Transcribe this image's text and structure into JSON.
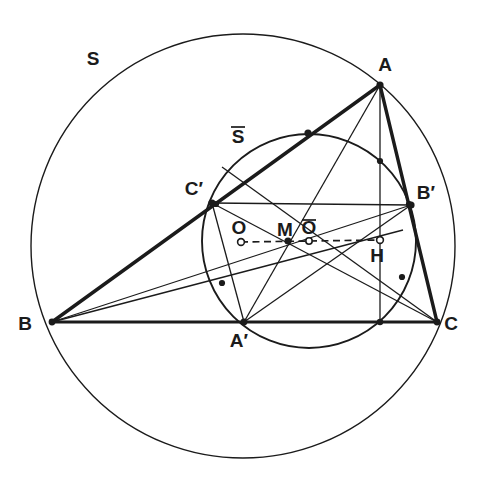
{
  "figure": {
    "background_color": "#ffffff",
    "stroke_color": "#1b1b1b",
    "width": 482,
    "height": 479
  },
  "labels": {
    "A": "A",
    "B": "B",
    "C": "C",
    "A_prime": "A′",
    "B_prime": "B′",
    "C_prime": "C′",
    "M": "M",
    "O": "O",
    "O_bar": "O",
    "H": "H",
    "S": "S",
    "S_bar": "S"
  },
  "points": {
    "A": {
      "x": 380,
      "y": 85,
      "label_dx": 5,
      "label_dy": -14,
      "marker": "dot"
    },
    "B": {
      "x": 52,
      "y": 322,
      "label_dx": -27,
      "label_dy": 7,
      "marker": "dot"
    },
    "C": {
      "x": 437,
      "y": 322,
      "label_dx": 10,
      "label_dy": 8,
      "marker": "dot"
    },
    "A_prime": {
      "x": 244,
      "y": 322,
      "label_dx": -8,
      "label_dy": 24,
      "marker": "dot"
    },
    "B_prime": {
      "x": 411,
      "y": 205,
      "label_dx": 9,
      "label_dy": -6,
      "marker": "dot"
    },
    "C_prime": {
      "x": 212,
      "y": 203,
      "label_dx": -32,
      "label_dy": -8,
      "marker": "dot"
    },
    "M": {
      "x": 288,
      "y": 241,
      "label_dx": -7,
      "label_dy": -12,
      "marker": "dot"
    },
    "O": {
      "x": 241,
      "y": 242,
      "label_dx": -7,
      "label_dy": -14,
      "marker": "open"
    },
    "O_bar": {
      "x": 309,
      "y": 241,
      "label_dx": -6,
      "label_dy": -14,
      "marker": "open"
    },
    "H": {
      "x": 380,
      "y": 240,
      "label_dx": -7,
      "label_dy": 22,
      "marker": "open"
    },
    "MidAB": {
      "x": 216,
      "y": 204
    },
    "MidAC": {
      "x": 409,
      "y": 204
    },
    "FootA": {
      "x": 380,
      "y": 322
    },
    "FootB": {
      "x": 222,
      "y": 283
    },
    "FootC": {
      "x": 403,
      "y": 276
    },
    "EulerMidAH": {
      "x": 380,
      "y": 163
    },
    "MidBH": {
      "x": 216,
      "y": 281
    },
    "MidCH": {
      "x": 409,
      "y": 281
    },
    "TopNine": {
      "x": 308,
      "y": 133
    }
  },
  "circles": {
    "circumcircle": {
      "name": "S",
      "cx": 243,
      "cy": 246,
      "r": 212,
      "label_x": 93,
      "label_y": 65,
      "stroke_width": 1.4
    },
    "nine_point_circle": {
      "name": "S-bar",
      "cx": 309,
      "cy": 241,
      "r": 107,
      "label_x": 236,
      "label_y": 143,
      "stroke_width": 1.8
    }
  },
  "segments": {
    "triangle_sides": [
      {
        "name": "side-AB",
        "from": "A",
        "to": "B",
        "width": 3.2
      },
      {
        "name": "side-BC",
        "from": "B",
        "to": "C",
        "width": 3.2
      },
      {
        "name": "side-CA",
        "from": "C",
        "to": "A",
        "width": 3.2
      }
    ],
    "medial_triangle": [
      {
        "name": "medial-A'B'",
        "from": "A_prime",
        "to": "B_prime",
        "width": 1.3
      },
      {
        "name": "medial-B'C'",
        "from": "B_prime",
        "to": "C_prime",
        "width": 1.3
      },
      {
        "name": "medial-C'A'",
        "from": "C_prime",
        "to": "A_prime",
        "width": 1.3
      }
    ],
    "medians": [
      {
        "name": "median-A-A'",
        "from": "A",
        "to": "A_prime",
        "width": 1.3
      },
      {
        "name": "median-B-B'",
        "from": "B",
        "to": "B_prime",
        "width": 1.3
      },
      {
        "name": "median-C-C'",
        "from": "C",
        "to": "C_prime",
        "width": 1.3
      }
    ],
    "altitudes": [
      {
        "name": "altitude-A",
        "from": "A",
        "to": "FootA",
        "width": 1.3
      },
      {
        "name": "altitude-B",
        "from": "B",
        "to": "FootB",
        "width": 1.3
      },
      {
        "name": "altitude-C",
        "from": "C",
        "to": "FootC",
        "width": 1.3
      }
    ],
    "euler_line": {
      "name": "euler-line-O-M-Obar-H",
      "from": "O",
      "to": "H",
      "style": "dashed",
      "dash": "6 4",
      "width": 1.6
    }
  },
  "nine_point_markers": [
    {
      "name": "midpoint-AB",
      "ref": "MidAB"
    },
    {
      "name": "midpoint-AC",
      "ref": "MidAC"
    },
    {
      "name": "midpoint-BC",
      "ref": "A_prime"
    },
    {
      "name": "foot-altitude-A",
      "ref": "FootA"
    },
    {
      "name": "foot-altitude-B",
      "ref": "FootB"
    },
    {
      "name": "foot-altitude-C",
      "ref": "FootC"
    },
    {
      "name": "euler-point-A",
      "ref": "EulerMidAH"
    },
    {
      "name": "euler-point-B",
      "ref": "MidBH"
    },
    {
      "name": "euler-point-C",
      "ref": "MidCH"
    },
    {
      "name": "nine-point-top",
      "ref": "TopNine"
    }
  ]
}
